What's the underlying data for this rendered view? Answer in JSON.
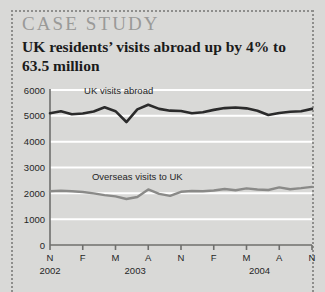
{
  "card": {
    "kicker": "CASE STUDY",
    "headline": "UK residents’ visits abroad up by 4% to 63.5 million",
    "headline_line1": "UK residents’ visits abroad up by 4%",
    "headline_line2": "to 63.5 million",
    "background_color": "#d9d9d7",
    "border_color": "#8e8e8c",
    "kicker_color": "#9a9a98"
  },
  "chart_data": {
    "type": "line",
    "title": "UK residents’ visits abroad up by 4% to 63.5 million",
    "xlabel": "",
    "ylabel": "",
    "ylim": [
      0,
      6000
    ],
    "ytick_labels": [
      "0",
      "1000",
      "2000",
      "3000",
      "4000",
      "5000",
      "6000"
    ],
    "yticks": [
      0,
      1000,
      2000,
      3000,
      4000,
      5000,
      6000
    ],
    "grid": true,
    "gridline_color": "#ffffff",
    "axis_color": "#6f6f6d",
    "legend": "inline-labels",
    "xtick_labels": [
      "N",
      "F",
      "M",
      "A",
      "N",
      "F",
      "M",
      "A",
      "N"
    ],
    "xtick_months": [
      "Nov 2002",
      "Feb 2003",
      "May 2003",
      "Aug 2003",
      "Nov 2003",
      "Feb 2004",
      "May 2004",
      "Aug 2004",
      "Nov 2004"
    ],
    "year_labels": [
      "2002",
      "2003",
      "2004"
    ],
    "x": [
      "Nov 2002",
      "Dec 2002",
      "Jan 2003",
      "Feb 2003",
      "Mar 2003",
      "Apr 2003",
      "May 2003",
      "Jun 2003",
      "Jul 2003",
      "Aug 2003",
      "Sep 2003",
      "Oct 2003",
      "Nov 2003",
      "Dec 2003",
      "Jan 2004",
      "Feb 2004",
      "Mar 2004",
      "Apr 2004",
      "May 2004",
      "Jun 2004",
      "Jul 2004",
      "Aug 2004",
      "Sep 2004",
      "Oct 2004",
      "Nov 2004"
    ],
    "series": [
      {
        "name": "UK visits abroad",
        "color": "#2b2b2b",
        "label_x_frac": 0.13,
        "label_y_value": 5850,
        "values": [
          5100,
          5180,
          5060,
          5090,
          5170,
          5330,
          5180,
          4760,
          5250,
          5430,
          5270,
          5200,
          5190,
          5100,
          5140,
          5230,
          5300,
          5320,
          5290,
          5200,
          5030,
          5110,
          5160,
          5180,
          5270
        ]
      },
      {
        "name": "Overseas visits to UK",
        "color": "#8a8a88",
        "label_x_frac": 0.16,
        "label_y_value": 2520,
        "values": [
          2080,
          2100,
          2080,
          2050,
          2000,
          1930,
          1880,
          1780,
          1860,
          2150,
          1980,
          1900,
          2060,
          2090,
          2080,
          2110,
          2170,
          2120,
          2190,
          2150,
          2130,
          2230,
          2160,
          2200,
          2250
        ]
      }
    ]
  }
}
